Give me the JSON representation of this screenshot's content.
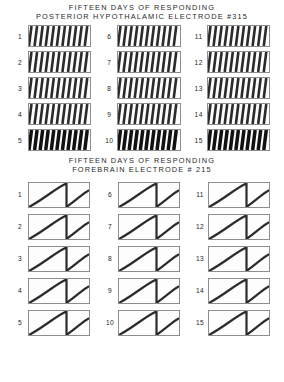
{
  "figure": {
    "panels": [
      {
        "id": "posterior-hypothalamic",
        "title_line1": "FIFTEEN  DAYS  OF  RESPONDING",
        "title_line2": "POSTERIOR  HYPOTHALAMIC  ELECTRODE  #315",
        "record_style": "dense-steep-sawtooth",
        "labels": [
          "1",
          "2",
          "3",
          "4",
          "5",
          "6",
          "7",
          "8",
          "9",
          "10",
          "11",
          "12",
          "13",
          "14",
          "15"
        ]
      },
      {
        "id": "forebrain",
        "title_line1": "FIFTEEN   DAYS  OF  RESPONDING",
        "title_line2": "FOREBRAIN  ELECTRODE  #  215",
        "record_style": "sparse-shallow-ramp",
        "labels": [
          "1",
          "2",
          "3",
          "4",
          "5",
          "6",
          "7",
          "8",
          "9",
          "10",
          "11",
          "12",
          "13",
          "14",
          "15"
        ]
      }
    ]
  },
  "chart_data": {
    "type": "line",
    "xlabel": "",
    "ylabel": "",
    "grid": false,
    "legend_position": "none",
    "panels": [
      {
        "name": "POSTERIOR HYPOTHALAMIC ELECTRODE #315",
        "trace_character": "very high, steep, near-vertical cumulative slopes with many pen resets per record",
        "resets_per_record": [
          11,
          11,
          11,
          11,
          11,
          11,
          11,
          11,
          11,
          11,
          11,
          11,
          11,
          11,
          11
        ],
        "series": [
          {
            "name": "1",
            "ramps": 11,
            "slope": "steep"
          },
          {
            "name": "2",
            "ramps": 11,
            "slope": "steep"
          },
          {
            "name": "3",
            "ramps": 11,
            "slope": "steep"
          },
          {
            "name": "4",
            "ramps": 11,
            "slope": "steep"
          },
          {
            "name": "5",
            "ramps": 11,
            "slope": "steep"
          },
          {
            "name": "6",
            "ramps": 11,
            "slope": "steep"
          },
          {
            "name": "7",
            "ramps": 11,
            "slope": "steep"
          },
          {
            "name": "8",
            "ramps": 11,
            "slope": "steep"
          },
          {
            "name": "9",
            "ramps": 11,
            "slope": "steep"
          },
          {
            "name": "10",
            "ramps": 11,
            "slope": "steep"
          },
          {
            "name": "11",
            "ramps": 11,
            "slope": "steep"
          },
          {
            "name": "12",
            "ramps": 11,
            "slope": "steep"
          },
          {
            "name": "13",
            "ramps": 11,
            "slope": "steep"
          },
          {
            "name": "14",
            "ramps": 11,
            "slope": "steep"
          },
          {
            "name": "15",
            "ramps": 11,
            "slope": "steep"
          }
        ]
      },
      {
        "name": "FOREBRAIN ELECTRODE # 215",
        "trace_character": "low, shallow cumulative slopes; roughly one full pen excursion plus a partial second one per record",
        "resets_per_record": [
          1,
          1,
          1,
          1,
          1,
          1,
          1,
          1,
          1,
          1,
          1,
          1,
          1,
          1,
          1
        ],
        "series": [
          {
            "name": "1",
            "ramps": 1.6,
            "slope": "shallow"
          },
          {
            "name": "2",
            "ramps": 1.6,
            "slope": "shallow"
          },
          {
            "name": "3",
            "ramps": 1.6,
            "slope": "shallow"
          },
          {
            "name": "4",
            "ramps": 1.6,
            "slope": "shallow"
          },
          {
            "name": "5",
            "ramps": 1.6,
            "slope": "shallow"
          },
          {
            "name": "6",
            "ramps": 1.6,
            "slope": "shallow"
          },
          {
            "name": "7",
            "ramps": 1.6,
            "slope": "shallow"
          },
          {
            "name": "8",
            "ramps": 1.6,
            "slope": "shallow"
          },
          {
            "name": "9",
            "ramps": 1.6,
            "slope": "shallow"
          },
          {
            "name": "10",
            "ramps": 1.6,
            "slope": "shallow"
          },
          {
            "name": "11",
            "ramps": 1.6,
            "slope": "shallow"
          },
          {
            "name": "12",
            "ramps": 1.6,
            "slope": "shallow"
          },
          {
            "name": "13",
            "ramps": 1.6,
            "slope": "shallow"
          },
          {
            "name": "14",
            "ramps": 1.6,
            "slope": "shallow"
          },
          {
            "name": "15",
            "ramps": 1.6,
            "slope": "shallow"
          }
        ]
      }
    ],
    "colors": {
      "trace": "#2b2b2b",
      "frame": "#8d8d8d",
      "background": "#ffffff"
    }
  }
}
